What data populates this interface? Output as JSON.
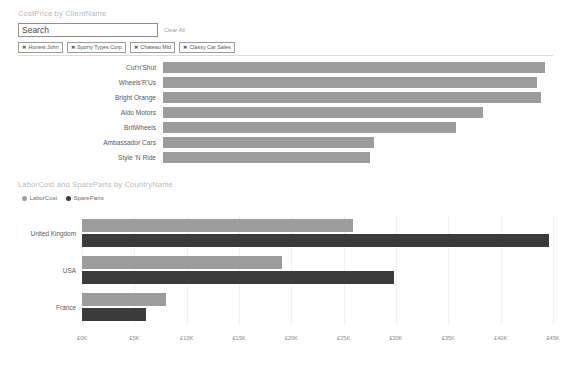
{
  "slicer": {
    "title": "CostPrice by ClientName",
    "search": {
      "placeholder": "Search",
      "value": ""
    },
    "clear_all_label": "Clear All",
    "remove_icon": "✖",
    "chips": [
      {
        "label": "Honest John"
      },
      {
        "label": "Sporty Types Corp"
      },
      {
        "label": "Chateau Mid"
      },
      {
        "label": "Classy Car Sales"
      }
    ]
  },
  "chart_data": [
    {
      "id": "costprice",
      "type": "bar",
      "orientation": "horizontal",
      "title": "CostPrice by ClientName",
      "xlabel": "",
      "ylabel": "",
      "grid": false,
      "legend": "none",
      "series_color": "#9c9c9c",
      "categories": [
        "Cut'n'Shut",
        "Wheels'R'Us",
        "Bright Orange",
        "Aldo Motors",
        "BritWheels",
        "Ambassador Cars",
        "Style 'N Ride"
      ],
      "values": [
        98,
        96,
        97,
        82,
        75,
        54,
        53
      ],
      "xlim": [
        0,
        100
      ]
    },
    {
      "id": "labor_spareparts",
      "type": "bar",
      "orientation": "horizontal",
      "title": "LaborCost and SpareParts by CountryName",
      "xlabel": "",
      "ylabel": "",
      "grid": true,
      "legend_position": "top-left",
      "categories": [
        "United Kingdom",
        "USA",
        "France"
      ],
      "series": [
        {
          "name": "LaborCost",
          "color": "#9c9c9c",
          "values": [
            25.9,
            19.1,
            8.0
          ]
        },
        {
          "name": "SpareParts",
          "color": "#3b3b3b",
          "values": [
            44.6,
            29.8,
            6.1
          ]
        }
      ],
      "xlim": [
        0,
        45
      ],
      "xticks": [
        0,
        5,
        10,
        15,
        20,
        25,
        30,
        35,
        40,
        45
      ],
      "xticklabels": [
        "£0K",
        "£5K",
        "£10K",
        "£15K",
        "£20K",
        "£25K",
        "£30K",
        "£35K",
        "£40K",
        "£45K"
      ]
    }
  ]
}
